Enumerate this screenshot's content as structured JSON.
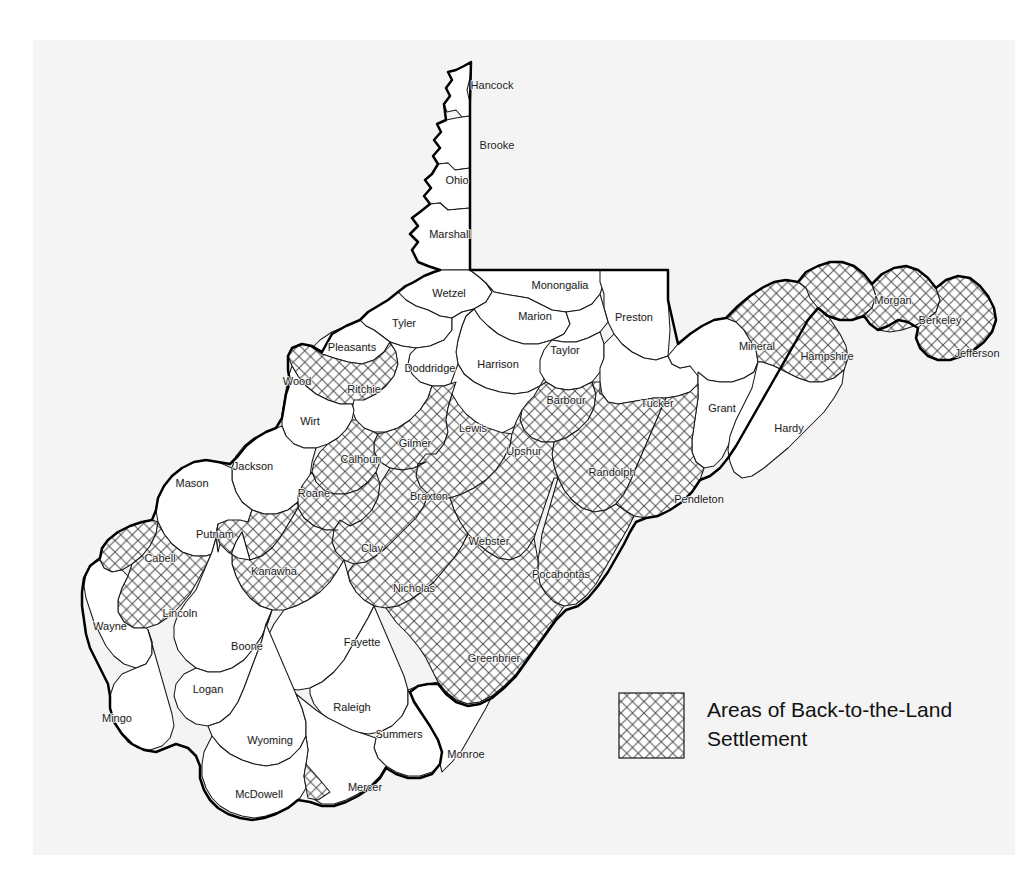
{
  "figure": {
    "kind": "thematic-county-map",
    "region": "West Virginia",
    "background_color": "#f4f4f4",
    "county_fill": "#ffffff",
    "county_stroke": "#1a1a1a",
    "state_outline_color": "#000000",
    "hatch_color": "#4a4a4a"
  },
  "legend": {
    "swatch_name": "crosshatch-swatch",
    "line1": "Areas of Back-to-the-Land",
    "line2": "Settlement"
  },
  "counties": [
    {
      "name": "Hancock",
      "hatched": false,
      "lx": 492,
      "ly": 89
    },
    {
      "name": "Brooke",
      "hatched": false,
      "lx": 497,
      "ly": 149
    },
    {
      "name": "Ohio",
      "hatched": false,
      "lx": 457,
      "ly": 184
    },
    {
      "name": "Marshall",
      "hatched": false,
      "lx": 450,
      "ly": 238
    },
    {
      "name": "Wetzel",
      "hatched": false,
      "lx": 449,
      "ly": 297
    },
    {
      "name": "Monongalia",
      "hatched": false,
      "lx": 560,
      "ly": 289
    },
    {
      "name": "Preston",
      "hatched": false,
      "lx": 634,
      "ly": 321
    },
    {
      "name": "Marion",
      "hatched": false,
      "lx": 535,
      "ly": 320
    },
    {
      "name": "Tyler",
      "hatched": false,
      "lx": 404,
      "ly": 327
    },
    {
      "name": "Pleasants",
      "hatched": false,
      "lx": 352,
      "ly": 351
    },
    {
      "name": "Doddridge",
      "hatched": false,
      "lx": 430,
      "ly": 372
    },
    {
      "name": "Harrison",
      "hatched": false,
      "lx": 498,
      "ly": 368
    },
    {
      "name": "Taylor",
      "hatched": false,
      "lx": 565,
      "ly": 354
    },
    {
      "name": "Wood",
      "hatched": true,
      "lx": 297,
      "ly": 385
    },
    {
      "name": "Ritchie",
      "hatched": false,
      "lx": 364,
      "ly": 393
    },
    {
      "name": "Barbour",
      "hatched": false,
      "lx": 566,
      "ly": 404
    },
    {
      "name": "Tucker",
      "hatched": false,
      "lx": 657,
      "ly": 407
    },
    {
      "name": "Mineral",
      "hatched": false,
      "lx": 757,
      "ly": 350
    },
    {
      "name": "Hampshire",
      "hatched": true,
      "lx": 827,
      "ly": 360
    },
    {
      "name": "Morgan",
      "hatched": true,
      "lx": 893,
      "ly": 304
    },
    {
      "name": "Berkeley",
      "hatched": true,
      "lx": 940,
      "ly": 324
    },
    {
      "name": "Jefferson",
      "hatched": true,
      "lx": 977,
      "ly": 357
    },
    {
      "name": "Grant",
      "hatched": false,
      "lx": 722,
      "ly": 412
    },
    {
      "name": "Hardy",
      "hatched": false,
      "lx": 789,
      "ly": 432
    },
    {
      "name": "Wirt",
      "hatched": false,
      "lx": 310,
      "ly": 425
    },
    {
      "name": "Lewis",
      "hatched": false,
      "lx": 473,
      "ly": 432
    },
    {
      "name": "Upshur",
      "hatched": true,
      "lx": 524,
      "ly": 455
    },
    {
      "name": "Gilmer",
      "hatched": true,
      "lx": 415,
      "ly": 447
    },
    {
      "name": "Calhoun",
      "hatched": true,
      "lx": 361,
      "ly": 463
    },
    {
      "name": "Jackson",
      "hatched": false,
      "lx": 253,
      "ly": 470
    },
    {
      "name": "Randolph",
      "hatched": true,
      "lx": 612,
      "ly": 476
    },
    {
      "name": "Mason",
      "hatched": false,
      "lx": 192,
      "ly": 487
    },
    {
      "name": "Roane",
      "hatched": true,
      "lx": 314,
      "ly": 497
    },
    {
      "name": "Braxton",
      "hatched": true,
      "lx": 429,
      "ly": 500
    },
    {
      "name": "Pendleton",
      "hatched": true,
      "lx": 699,
      "ly": 503
    },
    {
      "name": "Putnam",
      "hatched": true,
      "lx": 215,
      "ly": 538
    },
    {
      "name": "Clay",
      "hatched": true,
      "lx": 372,
      "ly": 552
    },
    {
      "name": "Webster",
      "hatched": true,
      "lx": 489,
      "ly": 545
    },
    {
      "name": "Cabell",
      "hatched": true,
      "lx": 160,
      "ly": 562
    },
    {
      "name": "Kanawha",
      "hatched": true,
      "lx": 274,
      "ly": 575
    },
    {
      "name": "Pocahontas",
      "hatched": true,
      "lx": 561,
      "ly": 578
    },
    {
      "name": "Nicholas",
      "hatched": true,
      "lx": 414,
      "ly": 592
    },
    {
      "name": "Lincoln",
      "hatched": true,
      "lx": 180,
      "ly": 617
    },
    {
      "name": "Wayne",
      "hatched": false,
      "lx": 110,
      "ly": 630
    },
    {
      "name": "Boone",
      "hatched": false,
      "lx": 247,
      "ly": 650
    },
    {
      "name": "Fayette",
      "hatched": false,
      "lx": 362,
      "ly": 646
    },
    {
      "name": "Greenbrier",
      "hatched": true,
      "lx": 494,
      "ly": 662
    },
    {
      "name": "Logan",
      "hatched": false,
      "lx": 208,
      "ly": 693
    },
    {
      "name": "Raleigh",
      "hatched": false,
      "lx": 352,
      "ly": 711
    },
    {
      "name": "Mingo",
      "hatched": false,
      "lx": 117,
      "ly": 722
    },
    {
      "name": "Summers",
      "hatched": false,
      "lx": 399,
      "ly": 738
    },
    {
      "name": "Wyoming",
      "hatched": false,
      "lx": 270,
      "ly": 744
    },
    {
      "name": "Monroe",
      "hatched": false,
      "lx": 466,
      "ly": 758
    },
    {
      "name": "Mercer",
      "hatched": false,
      "lx": 365,
      "ly": 791
    },
    {
      "name": "McDowell",
      "hatched": false,
      "lx": 259,
      "ly": 798
    }
  ]
}
